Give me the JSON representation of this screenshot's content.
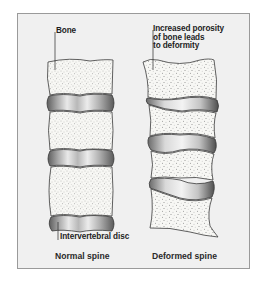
{
  "diagram": {
    "type": "medical-illustration",
    "colors": {
      "background": "#f0f0f0",
      "frame_border": "#9a9a9a",
      "bone_fill": "#f7f7f4",
      "bone_outline": "#3a3a3a",
      "disc_dark": "#6e6e6e",
      "disc_light": "#ededed"
    },
    "panels": [
      {
        "id": "normal",
        "caption": "Normal spine",
        "callouts": [
          {
            "label": "Bone"
          },
          {
            "label": "Intervertebral disc"
          }
        ],
        "vertebrae_count": 4,
        "disc_count": 4
      },
      {
        "id": "deformed",
        "caption": "Deformed spine",
        "callouts": [
          {
            "label": "Increased porosity\nof bone leads\nto deformity"
          }
        ],
        "vertebrae_count": 4,
        "disc_count": 3
      }
    ]
  }
}
